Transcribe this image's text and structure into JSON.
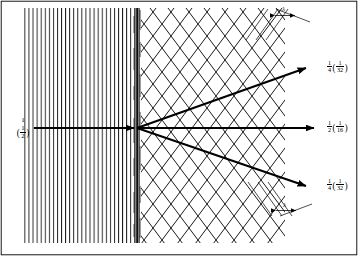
{
  "figure": {
    "background_color": "#ffffff",
    "line_color": "#000000",
    "width": 358,
    "height": 256
  },
  "regions": {
    "left": {
      "name": "aligned-lattice-planes",
      "pattern": "vertical-lines",
      "line_count": 28,
      "x_start": 22,
      "x_end": 136,
      "y_top": 8,
      "y_bottom": 243
    },
    "interface": {
      "name": "interface-band",
      "x": 137,
      "width": 5,
      "y_top": 8,
      "y_bottom": 243,
      "color": "#111111"
    },
    "right": {
      "name": "crosshatch-lattice",
      "pattern": "diamond-crosshatch",
      "x_start": 142,
      "x_end": 285,
      "y_top": 8,
      "y_bottom": 243,
      "cell_width": 18,
      "cell_height": 24
    }
  },
  "beams": {
    "incident": {
      "name": "incident-beam",
      "label_main": "1",
      "label_paren_num": "1",
      "label_paren_den": "2",
      "direction": "horizontal-right",
      "x_start": 34,
      "x_end": 137,
      "y": 128
    },
    "outputs": [
      {
        "name": "beam-up",
        "label_main_num": "1",
        "label_main_den": "4",
        "label_paren_num": "1",
        "label_paren_den": "32",
        "angle_deg": -22,
        "x_end": 310,
        "y_end": 68
      },
      {
        "name": "beam-straight",
        "label_main_num": "1",
        "label_main_den": "2",
        "label_paren_num": "1",
        "label_paren_den": "16",
        "angle_deg": 0,
        "x_end": 318,
        "y_end": 128
      },
      {
        "name": "beam-down",
        "label_main_num": "1",
        "label_main_den": "4",
        "label_paren_num": "1",
        "label_paren_den": "32",
        "angle_deg": 22,
        "x_end": 310,
        "y_end": 186
      }
    ],
    "convergence_point": {
      "x": 137,
      "y": 128
    }
  },
  "annotations": {
    "lambda_top": {
      "name": "lambda-spacing-top",
      "symbol": "λ",
      "x": 288,
      "y": 14
    },
    "lambda_bottom": {
      "name": "lambda-spacing-bottom",
      "symbol": "λ",
      "x": 288,
      "y": 210
    }
  }
}
